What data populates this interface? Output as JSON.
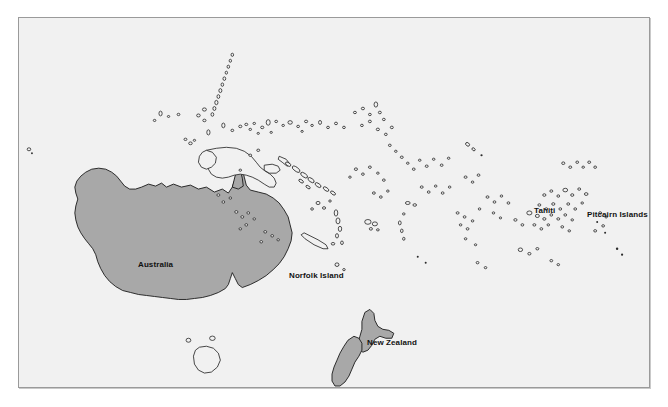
{
  "map": {
    "title": "Oceania and the Pacific Islands",
    "frame": {
      "background_color": "#f1f1f1",
      "border_color": "#9a9a9a",
      "page_background_color": "#ffffff",
      "x": 18,
      "y": 17,
      "width": 632,
      "height": 371
    },
    "style": {
      "filled_land_color": "#a8a8a8",
      "land_outline_color": "#1a1a1a",
      "unfilled_land_color": "#f1f1f1",
      "label_color": "#111111",
      "label_font_size_px": 8
    },
    "labels": [
      {
        "id": "australia",
        "text": "Australia",
        "x": 138,
        "y": 264,
        "align": "center"
      },
      {
        "id": "norfolk-island",
        "text": "Norfolk Island",
        "x": 313,
        "y": 278,
        "align": "left"
      },
      {
        "id": "new-zealand",
        "text": "New Zealand",
        "x": 368,
        "y": 344,
        "align": "left"
      },
      {
        "id": "tahiti",
        "text": "Tahiti",
        "x": 535,
        "y": 211,
        "align": "left"
      },
      {
        "id": "pitcairn-islands",
        "text": "Pitcairn Islands",
        "x": 605,
        "y": 218,
        "align": "center"
      }
    ],
    "watermark": {
      "text": "",
      "x": 424,
      "y": 98
    },
    "landmasses": [
      {
        "id": "australia",
        "name": "Australia",
        "fill": "filled"
      },
      {
        "id": "tasmania",
        "name": "Tasmania",
        "fill": "outline"
      },
      {
        "id": "new-zealand-north",
        "name": "New Zealand North Island",
        "fill": "filled"
      },
      {
        "id": "new-zealand-south",
        "name": "New Zealand South Island",
        "fill": "filled"
      },
      {
        "id": "stewart-island",
        "name": "Stewart Island",
        "fill": "filled"
      },
      {
        "id": "papua-new-guinea",
        "name": "Papua New Guinea",
        "fill": "outline"
      },
      {
        "id": "new-britain",
        "name": "New Britain",
        "fill": "outline"
      },
      {
        "id": "new-caledonia",
        "name": "New Caledonia",
        "fill": "outline"
      },
      {
        "id": "fiji",
        "name": "Fiji",
        "fill": "outline"
      },
      {
        "id": "solomon-islands",
        "name": "Solomon Islands",
        "fill": "outline"
      },
      {
        "id": "vanuatu",
        "name": "Vanuatu",
        "fill": "outline"
      },
      {
        "id": "mariana-chain",
        "name": "Mariana Islands",
        "fill": "outline"
      },
      {
        "id": "caroline-chain",
        "name": "Caroline Islands",
        "fill": "outline"
      },
      {
        "id": "marshall-chain",
        "name": "Marshall Islands",
        "fill": "outline"
      },
      {
        "id": "kiribati-chain",
        "name": "Kiribati",
        "fill": "outline"
      },
      {
        "id": "tuamotu-chain",
        "name": "Tuamotu Archipelago",
        "fill": "outline"
      },
      {
        "id": "pitcairn-group",
        "name": "Pitcairn Islands",
        "fill": "outline"
      }
    ],
    "marker_counts": {
      "small_island_outlines": 310,
      "island_dots": 96
    }
  }
}
